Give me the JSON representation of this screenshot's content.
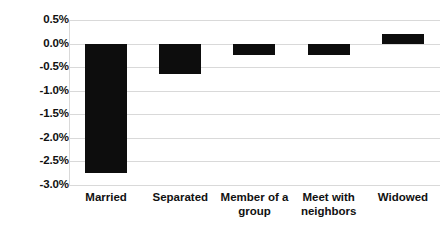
{
  "chart_data": {
    "type": "bar",
    "title": "",
    "subtitle": "",
    "xlabel": "",
    "ylabel": "",
    "categories": [
      "Married",
      "Separated",
      "Member of a\ngroup",
      "Meet with\nneighbors",
      "Widowed"
    ],
    "values": [
      -2.75,
      -0.65,
      -0.25,
      -0.25,
      0.2
    ],
    "value_labels": [
      "-2.75%",
      "-0.65%",
      "-0.25%",
      "-0.25%",
      "0.20%"
    ],
    "ylim": [
      -3.0,
      0.5
    ],
    "yticks": [
      0.5,
      0.0,
      -0.5,
      -1.0,
      -1.5,
      -2.0,
      -2.5,
      -3.0
    ],
    "ytick_labels": [
      "0.5%",
      "0.0%",
      "-0.5%",
      "-1.0%",
      "-1.5%",
      "-2.0%",
      "-2.5%",
      "-3.0%"
    ],
    "grid": true,
    "legend": false,
    "legend_position": "none",
    "bar_color": "#0d0d0d",
    "gridline_color": "#d9d9d9",
    "background_color": "#ffffff"
  }
}
